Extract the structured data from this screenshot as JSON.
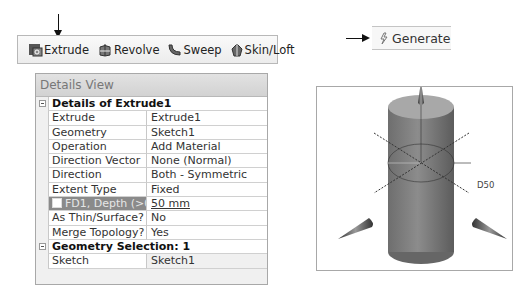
{
  "toolbar": {
    "buttons": [
      {
        "label": "Extrude",
        "icon": "extrude-icon"
      },
      {
        "label": "Revolve",
        "icon": "revolve-icon"
      },
      {
        "label": "Sweep",
        "icon": "sweep-icon"
      },
      {
        "label": "Skin/Loft",
        "icon": "skin-loft-icon"
      }
    ]
  },
  "generate": {
    "label": "Generate",
    "icon": "generate-icon"
  },
  "details": {
    "title": "Details View",
    "section1": "Details of Extrude1",
    "rows": [
      {
        "key": "Extrude",
        "value": "Extrude1"
      },
      {
        "key": "Geometry",
        "value": "Sketch1"
      },
      {
        "key": "Operation",
        "value": "Add Material"
      },
      {
        "key": "Direction Vector",
        "value": "None (Normal)"
      },
      {
        "key": "Direction",
        "value": "Both - Symmetric"
      },
      {
        "key": "Extent Type",
        "value": "Fixed"
      },
      {
        "key": "FD1, Depth (>0)",
        "value": "50 mm"
      },
      {
        "key": "As Thin/Surface?",
        "value": "No"
      },
      {
        "key": "Merge Topology?",
        "value": "Yes"
      }
    ],
    "section2": "Geometry Selection: 1",
    "rows2": [
      {
        "key": "Sketch",
        "value": "Sketch1"
      }
    ]
  },
  "viewport": {
    "dimension_label": "D50"
  }
}
